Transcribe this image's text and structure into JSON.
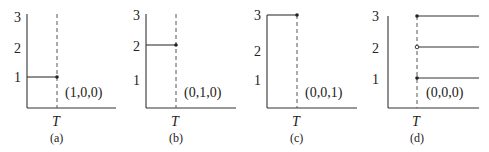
{
  "figure": {
    "y_ticks": [
      "1",
      "2",
      "3"
    ],
    "x_tick": "T",
    "panels": [
      {
        "id": "a",
        "caption": "(a)",
        "tuple_label": "(1,0,0)",
        "levels_before_T": [
          1
        ],
        "levels_after_T": [],
        "vertical_drop_from": null
      },
      {
        "id": "b",
        "caption": "(b)",
        "tuple_label": "(0,1,0)",
        "levels_before_T": [
          2
        ],
        "levels_after_T": [],
        "vertical_drop_from": null
      },
      {
        "id": "c",
        "caption": "(c)",
        "tuple_label": "(0,0,1)",
        "levels_before_T": [
          3
        ],
        "levels_after_T": [],
        "vertical_drop_from": 3
      },
      {
        "id": "d",
        "caption": "(d)",
        "tuple_label": "(0,0,0)",
        "levels_before_T": [],
        "levels_after_T": [
          1,
          2,
          3
        ],
        "vertical_drop_from": null
      }
    ]
  }
}
